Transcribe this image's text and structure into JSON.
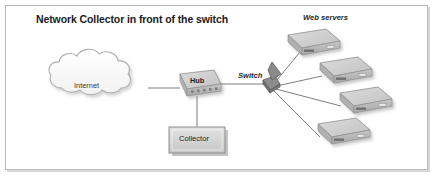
{
  "figure": {
    "title": "Network Collector in front of the switch",
    "type": "network-diagram"
  },
  "nodes": {
    "cloud": {
      "label": "Internet",
      "icon": "cloud-icon"
    },
    "hub": {
      "label": "Hub",
      "icon": "hub-device-icon"
    },
    "collector": {
      "label": "Collector",
      "icon": "collector-box-icon"
    },
    "switch": {
      "label": "Switch",
      "icon": "switch-device-icon"
    },
    "servers_group": {
      "label": "Web servers",
      "icon": "server-icon",
      "count": 4
    }
  },
  "servers": [
    {
      "name": "web-server-1"
    },
    {
      "name": "web-server-2"
    },
    {
      "name": "web-server-3"
    },
    {
      "name": "web-server-4"
    }
  ],
  "colors": {
    "frame_border": "#b9b9b9",
    "frame_shadow": "#d8d8d8",
    "device_top": "#d2d2d2",
    "device_side": "#a8a8a8",
    "device_front": "#bdbdbd",
    "line": "#6e6e6e",
    "text": "#1f1f1f",
    "shadow": "#c9c9c9",
    "switch_dark": "#5a5a5a"
  }
}
